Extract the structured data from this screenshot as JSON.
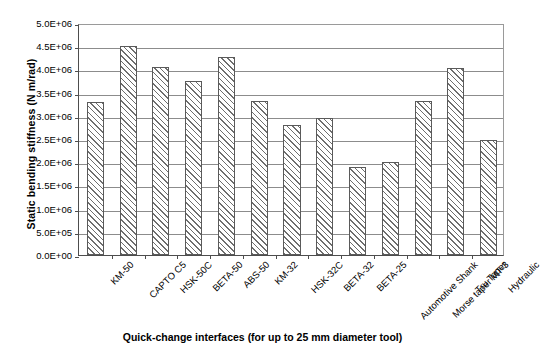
{
  "chart_data": {
    "type": "bar",
    "title": "",
    "xlabel": "Quick-change interfaces (for up to 25 mm diameter tool)",
    "ylabel": "Static bending stiffness (N m/rad)",
    "ylim": [
      0,
      5000000
    ],
    "ytick_values": [
      0,
      500000,
      1000000,
      1500000,
      2000000,
      2500000,
      3000000,
      3500000,
      4000000,
      4500000,
      5000000
    ],
    "ytick_labels": [
      "0.0E+00",
      "5.0E+05",
      "1.0E+06",
      "1.5E+06",
      "2.0E+06",
      "2.5E+06",
      "3.0E+06",
      "3.5E+06",
      "4.0E+06",
      "4.5E+06",
      "5.0E+06"
    ],
    "grid": true,
    "legend": false,
    "bar_fill": "hatched-diagonal",
    "categories": [
      "KM-50",
      "CAPTO C5",
      "HSK-50C",
      "BETA-50",
      "ABS-50",
      "KM-32",
      "HSK-32C",
      "BETA-32",
      "BETA-25",
      "Automotive Shank",
      "Morse taper MT-3",
      "Tru Taper",
      "Hydraulic"
    ],
    "values": [
      3300000,
      4510000,
      4050000,
      3760000,
      4270000,
      3330000,
      2800000,
      2960000,
      1900000,
      2000000,
      3320000,
      4030000,
      2470000
    ],
    "value_labels": [
      "3.30E+06",
      "4.51E+06",
      "4.05E+06",
      "3.76E+06",
      "4.27E+06",
      "3.33E+06",
      "2.80E+06",
      "2.96E+06",
      "1.90E+06",
      "2.00E+06",
      "3.32E+06",
      "4.03E+06",
      "2.47E+06"
    ]
  },
  "colors": {
    "axis": "#4d4d4d",
    "gridline": "#8c8c8c",
    "bar_outline": "#5a5a5a",
    "bar_hatch": "#6e6e6e",
    "background": "#ffffff",
    "text": "#000000"
  }
}
